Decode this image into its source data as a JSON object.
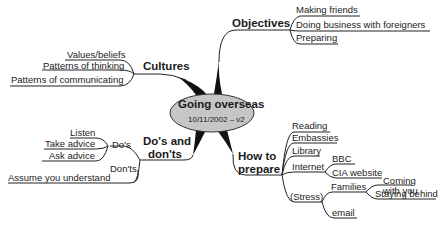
{
  "center": {
    "title": "Going overseas",
    "subtitle": "10/11/2002 – v2",
    "fill": "#c6c6c6"
  },
  "branches": {
    "objectives": {
      "label": "Objectives",
      "children": [
        "Making friends",
        "Doing business with foreigners",
        "Preparing"
      ]
    },
    "cultures": {
      "label": "Cultures",
      "children": [
        "Values/beliefs",
        "Patterns of thinking",
        "Patterns of communicating"
      ]
    },
    "dos_donts": {
      "label_line1": "Do's and",
      "label_line2": "don'ts",
      "dos": {
        "label": "Do's",
        "children": [
          "Listen",
          "Take advice",
          "Ask advice"
        ]
      },
      "donts": {
        "label": "Don'ts",
        "children": [
          "Assume you understand"
        ]
      }
    },
    "how_to_prepare": {
      "label_line1": "How to",
      "label_line2": "prepare",
      "children": {
        "reading": "Reading",
        "embassies": "Embassies",
        "library": "Library",
        "internet": {
          "label": "Internet",
          "children": [
            "BBC",
            "CIA website"
          ]
        },
        "stress": {
          "label": "(Stress)",
          "families": {
            "label": "Families",
            "children": [
              "Coming\nwith you",
              "Staying behind"
            ],
            "coming_line1": "Coming",
            "coming_line2": "with you"
          },
          "email": "email"
        }
      }
    }
  }
}
